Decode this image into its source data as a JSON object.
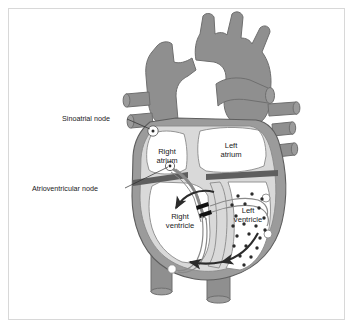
{
  "figure": {
    "type": "anatomical-diagram",
    "frame": {
      "border_color": "#d8d8d8",
      "background": "#ffffff"
    }
  },
  "callout_labels": [
    {
      "id": "sinoatrial-node",
      "text": "Sinoatrial node",
      "text_x": 62,
      "text_y": 121,
      "leader": "M 127,119 L 150,129"
    },
    {
      "id": "atrioventricular-node",
      "text": "Atrioventricular node",
      "text_x": 32,
      "text_y": 191,
      "leader": "M 125,188 L 168,167"
    }
  ],
  "chamber_labels": [
    {
      "id": "right-atrium",
      "line1": "Right",
      "line2": "atrium",
      "x": 167,
      "y": 154
    },
    {
      "id": "left-atrium",
      "line1": "Left",
      "line2": "atrium",
      "x": 231,
      "y": 148
    },
    {
      "id": "right-ventricle",
      "line1": "Right",
      "line2": "ventricle",
      "x": 180,
      "y": 219
    },
    {
      "id": "left-ventricle",
      "line1": "Left",
      "line2": "ventricle",
      "x": 248,
      "y": 213
    }
  ],
  "colors": {
    "vessel_gray": "#8f8f8f",
    "vessel_outline": "#6f6f6f",
    "myocardium_outer": "#9b9b9b",
    "myocardium_inner": "#d9d9d9",
    "chamber_fill": "#ffffff",
    "septum_dark": "#5e5e5e",
    "conduction_line": "#8a8a8a",
    "arrow_dark": "#2b2b2b",
    "purkinje_dot": "#2b2b2b",
    "text": "#1a1a1a",
    "frame": "#d8d8d8"
  },
  "features": {
    "sa_node_marker": {
      "cx": 153,
      "cy": 131,
      "r": 5.2
    },
    "av_node_marker": {
      "cx": 170,
      "cy": 166,
      "r": 4.6
    },
    "bundle_of_his_marks": 2,
    "purkinje_dot_count": 21,
    "flow_arrow_count": 3,
    "great_vessel_stub_count": 7
  }
}
